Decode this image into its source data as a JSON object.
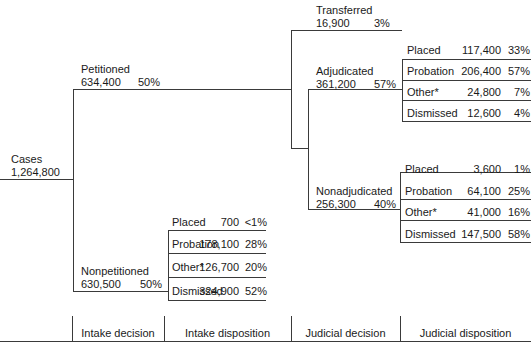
{
  "root": {
    "label": "Cases",
    "value": "1,264,800"
  },
  "petitioned": {
    "label": "Petitioned",
    "value": "634,400",
    "pct": "50%"
  },
  "nonpetitioned": {
    "label": "Nonpetitioned",
    "value": "630,500",
    "pct": "50%"
  },
  "transferred": {
    "label": "Transferred",
    "value": "16,900",
    "pct": "3%"
  },
  "adjudicated": {
    "label": "Adjudicated",
    "value": "361,200",
    "pct": "57%"
  },
  "nonadjudicated": {
    "label": "Nonadjudicated",
    "value": "256,300",
    "pct": "40%"
  },
  "intake_disposition": [
    {
      "label": "Placed",
      "value": "700",
      "pct": "<1%"
    },
    {
      "label": "Probation",
      "value": "178,100",
      "pct": "28%"
    },
    {
      "label": "Other*",
      "value": "126,700",
      "pct": "20%"
    },
    {
      "label": "Dismissed",
      "value": "324,900",
      "pct": "52%"
    }
  ],
  "adjudicated_disposition": [
    {
      "label": "Placed",
      "value": "117,400",
      "pct": "33%"
    },
    {
      "label": "Probation",
      "value": "206,400",
      "pct": "57%"
    },
    {
      "label": "Other*",
      "value": "24,800",
      "pct": "7%"
    },
    {
      "label": "Dismissed",
      "value": "12,600",
      "pct": "4%"
    }
  ],
  "nonadjudicated_disposition": [
    {
      "label": "Placed",
      "value": "3,600",
      "pct": "1%"
    },
    {
      "label": "Probation",
      "value": "64,100",
      "pct": "25%"
    },
    {
      "label": "Other*",
      "value": "41,000",
      "pct": "16%"
    },
    {
      "label": "Dismissed",
      "value": "147,500",
      "pct": "58%"
    }
  ],
  "axis": {
    "stages": [
      "Intake decision",
      "Intake disposition",
      "Judicial decision",
      "Judicial disposition"
    ]
  }
}
